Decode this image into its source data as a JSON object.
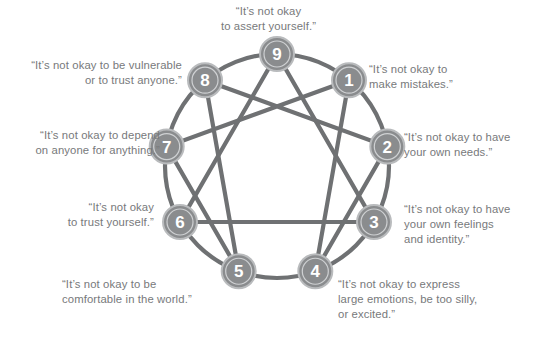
{
  "diagram": {
    "colors": {
      "line": "#6f7173",
      "node_fill": "#8a8c8e",
      "node_ring": "#b9bbbd",
      "node_text": "#ffffff",
      "label_text": "#77797b",
      "background": "#ffffff"
    },
    "geometry": {
      "center_x": 277,
      "center_y": 166,
      "radius": 112,
      "node_radius": 17
    },
    "nodes": [
      {
        "id": "9",
        "number": "9",
        "angle_deg": -90,
        "label_position": "top"
      },
      {
        "id": "1",
        "number": "1",
        "angle_deg": -50,
        "label_position": "right"
      },
      {
        "id": "2",
        "number": "2",
        "angle_deg": -10,
        "label_position": "right"
      },
      {
        "id": "3",
        "number": "3",
        "angle_deg": 30,
        "label_position": "right"
      },
      {
        "id": "4",
        "number": "4",
        "angle_deg": 70,
        "label_position": "right"
      },
      {
        "id": "5",
        "number": "5",
        "angle_deg": 110,
        "label_position": "left"
      },
      {
        "id": "6",
        "number": "6",
        "angle_deg": 150,
        "label_position": "left"
      },
      {
        "id": "7",
        "number": "7",
        "angle_deg": 190,
        "label_position": "left"
      },
      {
        "id": "8",
        "number": "8",
        "angle_deg": 230,
        "label_position": "left"
      }
    ],
    "inner_triangle": [
      "9",
      "3",
      "6"
    ],
    "hexad_path": [
      "1",
      "4",
      "2",
      "8",
      "5",
      "7"
    ],
    "labels": {
      "9": "“It’s not okay\nto assert yourself.”",
      "1": "“It’s not okay to\nmake mistakes.”",
      "2": "“It’s not okay to have\nyour own needs.”",
      "3": "“It’s not okay to have\nyour own feelings\nand identity.”",
      "4": "“It’s not okay to express\nlarge emotions, be too silly,\nor excited.”",
      "5": "“It’s not okay to be\ncomfortable in the world.”",
      "6": "“It’s not okay\nto trust yourself.”",
      "7": "“It’s not okay to depend\non anyone for anything.”",
      "8": "“It’s not okay to be vulnerable\nor to trust anyone.”"
    }
  }
}
